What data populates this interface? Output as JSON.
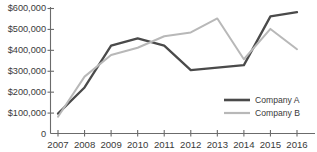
{
  "chart_data": {
    "type": "line",
    "title": "",
    "subtitle": "",
    "xlabel": "",
    "ylabel": "",
    "categories": [
      "2007",
      "2008",
      "2009",
      "2010",
      "2011",
      "2012",
      "2013",
      "2014",
      "2015",
      "2016"
    ],
    "series": [
      {
        "name": "Company A",
        "color": "#4a4a4a",
        "values": [
          95000,
          220000,
          420000,
          455000,
          420000,
          303000,
          315000,
          327000,
          560000,
          580000
        ]
      },
      {
        "name": "Company B",
        "color": "#b8b8b8",
        "values": [
          80000,
          272000,
          375000,
          410000,
          465000,
          483000,
          550000,
          355000,
          500000,
          403000
        ]
      }
    ],
    "ylim": [
      0,
      600000
    ],
    "y_ticks": [
      0,
      100000,
      200000,
      300000,
      400000,
      500000,
      600000
    ],
    "y_tick_labels": [
      "0",
      "$100,000",
      "$200,000",
      "$300,000",
      "$400,000",
      "$500,000",
      "$600,000"
    ],
    "x_tick_labels": [
      "2007",
      "2008",
      "2009",
      "2010",
      "2011",
      "2012",
      "2013",
      "2014",
      "2015",
      "2016"
    ],
    "grid": false,
    "legend_position": "bottom-right",
    "legend_entries": [
      {
        "label": "Company A",
        "color": "#4a4a4a"
      },
      {
        "label": "Company B",
        "color": "#b8b8b8"
      }
    ]
  },
  "axes": {
    "y_axis_name": "y-axis",
    "x_axis_name": "x-axis"
  }
}
